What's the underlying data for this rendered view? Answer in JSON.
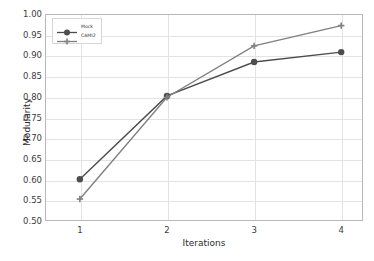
{
  "chart_data": {
    "type": "line",
    "title": "",
    "xlabel": "Iterations",
    "ylabel": "Modularity",
    "x": [
      1,
      2,
      3,
      4
    ],
    "xtick_labels": [
      "1",
      "2",
      "3",
      "4"
    ],
    "ytick_labels": [
      "0.50",
      "0.55",
      "0.60",
      "0.65",
      "0.70",
      "0.75",
      "0.80",
      "0.85",
      "0.90",
      "0.95",
      "1.00"
    ],
    "ytick_values": [
      0.5,
      0.55,
      0.6,
      0.65,
      0.7,
      0.75,
      0.8,
      0.85,
      0.9,
      0.95,
      1.0
    ],
    "xlim": [
      0.6,
      4.25
    ],
    "ylim": [
      0.5,
      1.0
    ],
    "grid": true,
    "legend_position": "upper left",
    "series": [
      {
        "name": "Mock",
        "color": "#4d4d4d",
        "marker": "circle",
        "values": [
          0.601,
          0.802,
          0.884,
          0.908
        ]
      },
      {
        "name": "CAMI2",
        "color": "#808080",
        "marker": "plus",
        "values": [
          0.553,
          0.799,
          0.923,
          0.972
        ]
      }
    ]
  },
  "axes": {
    "frame_color": "#b8b8b8",
    "grid_color": "#e3e3e3",
    "background": "#ffffff"
  }
}
